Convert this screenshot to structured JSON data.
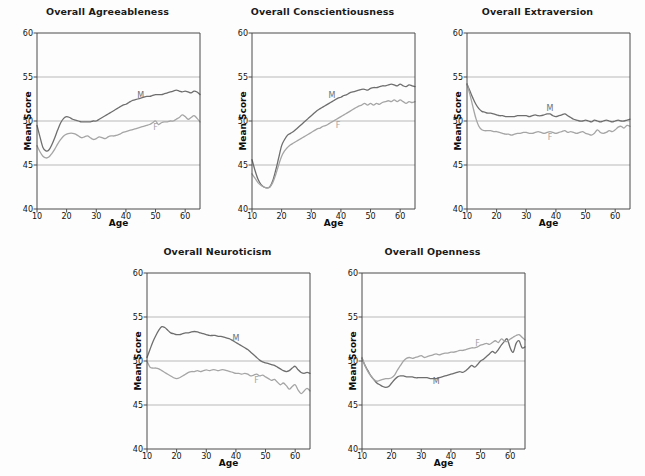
{
  "figure": {
    "background": "#fdfdfd",
    "axis_color": "#4a4a4a",
    "grid_color": "#b9b9b9",
    "male_color": "#6e6e6e",
    "female_color": "#a5a5a5",
    "male_label": "M",
    "female_label": "F",
    "y_axis_label": "Mean Score",
    "x_axis_label": "Age"
  },
  "chart_data": [
    {
      "type": "line",
      "title": "Overall Agreeableness",
      "xlabel": "Age",
      "ylabel": "Mean Score",
      "xlim": [
        10,
        65
      ],
      "ylim": [
        40,
        60
      ],
      "xticks": [
        10,
        20,
        30,
        40,
        50,
        60
      ],
      "yticks": [
        40,
        45,
        50,
        55,
        60
      ],
      "grid": "horizontal",
      "legend": "inline-labels",
      "x": [
        10,
        11,
        12,
        13,
        14,
        15,
        16,
        17,
        18,
        19,
        20,
        21,
        22,
        23,
        24,
        25,
        26,
        27,
        28,
        29,
        30,
        31,
        32,
        33,
        34,
        35,
        36,
        37,
        38,
        39,
        40,
        41,
        42,
        43,
        44,
        45,
        46,
        47,
        48,
        49,
        50,
        51,
        52,
        53,
        54,
        55,
        56,
        57,
        58,
        59,
        60,
        61,
        62,
        63,
        64,
        65
      ],
      "series": [
        {
          "name": "M",
          "label": "M",
          "color": "#6e6e6e",
          "label_x": 45,
          "label_y": 52.9,
          "values": [
            49.5,
            48.2,
            47.0,
            46.6,
            46.7,
            47.3,
            48.1,
            49.0,
            49.8,
            50.3,
            50.5,
            50.4,
            50.2,
            50.1,
            50.0,
            49.9,
            49.9,
            49.9,
            49.9,
            50.0,
            50.0,
            50.2,
            50.4,
            50.6,
            50.8,
            51.0,
            51.2,
            51.4,
            51.6,
            51.8,
            51.9,
            52.1,
            52.3,
            52.4,
            52.5,
            52.6,
            52.7,
            52.8,
            52.8,
            52.9,
            53.0,
            53.0,
            53.0,
            53.1,
            53.2,
            53.3,
            53.4,
            53.5,
            53.4,
            53.3,
            53.4,
            53.3,
            53.2,
            53.4,
            53.3,
            53.0
          ]
        },
        {
          "name": "F",
          "label": "F",
          "color": "#a5a5a5",
          "label_x": 50,
          "label_y": 49.3,
          "values": [
            47.2,
            46.5,
            46.0,
            45.8,
            45.9,
            46.3,
            46.8,
            47.4,
            47.9,
            48.3,
            48.5,
            48.6,
            48.6,
            48.5,
            48.3,
            48.1,
            48.2,
            48.3,
            48.1,
            47.9,
            48.0,
            48.2,
            48.1,
            48.0,
            48.2,
            48.3,
            48.3,
            48.4,
            48.5,
            48.7,
            48.8,
            48.9,
            49.0,
            49.1,
            49.2,
            49.3,
            49.4,
            49.5,
            49.6,
            49.8,
            50.0,
            49.6,
            49.8,
            49.9,
            49.9,
            50.0,
            50.0,
            50.2,
            50.4,
            50.7,
            50.5,
            50.2,
            50.4,
            50.6,
            50.3,
            49.9
          ]
        }
      ]
    },
    {
      "type": "line",
      "title": "Overall Conscientiousness",
      "xlabel": "Age",
      "ylabel": "Mean Score",
      "xlim": [
        10,
        65
      ],
      "ylim": [
        40,
        60
      ],
      "xticks": [
        10,
        20,
        30,
        40,
        50,
        60
      ],
      "yticks": [
        40,
        45,
        50,
        55,
        60
      ],
      "grid": "horizontal",
      "legend": "inline-labels",
      "x": [
        10,
        11,
        12,
        13,
        14,
        15,
        16,
        17,
        18,
        19,
        20,
        21,
        22,
        23,
        24,
        25,
        26,
        27,
        28,
        29,
        30,
        31,
        32,
        33,
        34,
        35,
        36,
        37,
        38,
        39,
        40,
        41,
        42,
        43,
        44,
        45,
        46,
        47,
        48,
        49,
        50,
        51,
        52,
        53,
        54,
        55,
        56,
        57,
        58,
        59,
        60,
        61,
        62,
        63,
        64,
        65
      ],
      "series": [
        {
          "name": "M",
          "label": "M",
          "color": "#6e6e6e",
          "label_x": 37,
          "label_y": 52.9,
          "values": [
            45.6,
            44.4,
            43.4,
            42.8,
            42.5,
            42.4,
            42.5,
            43.2,
            44.4,
            45.8,
            47.2,
            47.9,
            48.4,
            48.6,
            48.8,
            49.1,
            49.4,
            49.7,
            50.0,
            50.3,
            50.6,
            50.9,
            51.2,
            51.4,
            51.6,
            51.8,
            52.0,
            52.2,
            52.4,
            52.6,
            52.7,
            52.9,
            53.0,
            53.2,
            53.3,
            53.4,
            53.5,
            53.6,
            53.6,
            53.5,
            53.7,
            53.8,
            53.8,
            53.9,
            54.0,
            54.0,
            54.1,
            54.2,
            54.1,
            54.0,
            54.2,
            54.0,
            53.9,
            54.1,
            54.0,
            53.9
          ]
        },
        {
          "name": "F",
          "label": "F",
          "color": "#a5a5a5",
          "label_x": 39,
          "label_y": 49.6,
          "values": [
            44.0,
            43.5,
            43.0,
            42.7,
            42.5,
            42.4,
            42.5,
            43.0,
            43.9,
            45.0,
            46.0,
            46.6,
            47.0,
            47.3,
            47.5,
            47.7,
            47.9,
            48.1,
            48.3,
            48.5,
            48.7,
            48.9,
            49.1,
            49.2,
            49.4,
            49.5,
            49.7,
            49.9,
            50.1,
            50.3,
            50.5,
            50.7,
            50.9,
            51.1,
            51.3,
            51.5,
            51.7,
            51.8,
            52.0,
            51.8,
            52.0,
            51.8,
            52.0,
            51.9,
            52.1,
            52.2,
            52.3,
            52.2,
            52.4,
            52.2,
            52.4,
            52.2,
            52.0,
            52.2,
            52.1,
            52.2
          ]
        }
      ]
    },
    {
      "type": "line",
      "title": "Overall Extraversion",
      "xlabel": "Age",
      "ylabel": "Mean Score",
      "xlim": [
        10,
        65
      ],
      "ylim": [
        40,
        60
      ],
      "xticks": [
        10,
        20,
        30,
        40,
        50,
        60
      ],
      "yticks": [
        40,
        45,
        50,
        55,
        60
      ],
      "grid": "horizontal",
      "legend": "inline-labels",
      "x": [
        10,
        11,
        12,
        13,
        14,
        15,
        16,
        17,
        18,
        19,
        20,
        21,
        22,
        23,
        24,
        25,
        26,
        27,
        28,
        29,
        30,
        31,
        32,
        33,
        34,
        35,
        36,
        37,
        38,
        39,
        40,
        41,
        42,
        43,
        44,
        45,
        46,
        47,
        48,
        49,
        50,
        51,
        52,
        53,
        54,
        55,
        56,
        57,
        58,
        59,
        60,
        61,
        62,
        63,
        64,
        65
      ],
      "series": [
        {
          "name": "M",
          "label": "M",
          "color": "#6e6e6e",
          "label_x": 38,
          "label_y": 51.5,
          "values": [
            54.2,
            53.4,
            52.6,
            51.9,
            51.4,
            51.1,
            51.0,
            50.9,
            50.9,
            50.8,
            50.7,
            50.6,
            50.6,
            50.5,
            50.5,
            50.5,
            50.5,
            50.6,
            50.6,
            50.6,
            50.6,
            50.5,
            50.6,
            50.7,
            50.6,
            50.6,
            50.7,
            50.8,
            50.8,
            50.6,
            50.5,
            50.6,
            50.7,
            50.8,
            50.6,
            50.4,
            50.2,
            50.1,
            50.0,
            50.0,
            50.1,
            50.0,
            49.9,
            50.1,
            50.0,
            49.9,
            50.0,
            50.1,
            50.0,
            49.9,
            50.0,
            50.1,
            50.0,
            50.0,
            50.1,
            50.2
          ]
        },
        {
          "name": "F",
          "label": "F",
          "color": "#a5a5a5",
          "label_x": 38,
          "label_y": 48.2,
          "values": [
            54.2,
            53.0,
            51.6,
            50.3,
            49.4,
            49.0,
            48.9,
            48.9,
            48.9,
            48.8,
            48.8,
            48.7,
            48.6,
            48.5,
            48.5,
            48.4,
            48.5,
            48.6,
            48.6,
            48.7,
            48.7,
            48.6,
            48.6,
            48.7,
            48.8,
            48.7,
            48.6,
            48.7,
            48.8,
            48.7,
            48.6,
            48.7,
            48.8,
            48.9,
            48.7,
            48.8,
            48.7,
            48.6,
            48.7,
            48.8,
            48.6,
            48.5,
            48.4,
            48.6,
            49.0,
            48.7,
            48.6,
            48.7,
            48.9,
            48.8,
            49.0,
            49.3,
            49.4,
            49.2,
            49.5,
            49.4
          ]
        }
      ]
    },
    {
      "type": "line",
      "title": "Overall Neuroticism",
      "xlabel": "Age",
      "ylabel": "Mean Score",
      "xlim": [
        10,
        65
      ],
      "ylim": [
        40,
        60
      ],
      "xticks": [
        10,
        20,
        30,
        40,
        50,
        60
      ],
      "yticks": [
        40,
        45,
        50,
        55,
        60
      ],
      "grid": "horizontal",
      "legend": "inline-labels",
      "x": [
        10,
        11,
        12,
        13,
        14,
        15,
        16,
        17,
        18,
        19,
        20,
        21,
        22,
        23,
        24,
        25,
        26,
        27,
        28,
        29,
        30,
        31,
        32,
        33,
        34,
        35,
        36,
        37,
        38,
        39,
        40,
        41,
        42,
        43,
        44,
        45,
        46,
        47,
        48,
        49,
        50,
        51,
        52,
        53,
        54,
        55,
        56,
        57,
        58,
        59,
        60,
        61,
        62,
        63,
        64,
        65
      ],
      "series": [
        {
          "name": "M",
          "label": "M",
          "color": "#6e6e6e",
          "label_x": 40,
          "label_y": 52.6,
          "values": [
            50.4,
            51.3,
            52.2,
            52.9,
            53.5,
            53.9,
            53.8,
            53.5,
            53.2,
            53.1,
            53.0,
            53.0,
            53.1,
            53.2,
            53.2,
            53.3,
            53.35,
            53.3,
            53.2,
            53.1,
            53.0,
            52.9,
            52.9,
            52.9,
            52.8,
            52.8,
            52.7,
            52.6,
            52.5,
            52.3,
            52.1,
            51.9,
            51.7,
            51.5,
            51.3,
            51.0,
            50.7,
            50.4,
            50.1,
            49.9,
            49.8,
            49.7,
            49.6,
            49.5,
            49.3,
            49.1,
            48.9,
            48.8,
            48.9,
            49.2,
            49.4,
            49.0,
            48.7,
            48.6,
            48.7,
            48.6
          ]
        },
        {
          "name": "F",
          "label": "F",
          "color": "#a5a5a5",
          "label_x": 47,
          "label_y": 47.8,
          "values": [
            50.0,
            49.3,
            49.2,
            49.2,
            49.1,
            48.9,
            48.7,
            48.5,
            48.3,
            48.1,
            48.0,
            48.1,
            48.3,
            48.5,
            48.7,
            48.8,
            48.8,
            48.9,
            48.8,
            48.9,
            49.0,
            48.9,
            49.0,
            49.0,
            48.9,
            49.0,
            49.0,
            48.9,
            48.8,
            48.7,
            48.6,
            48.6,
            48.5,
            48.6,
            48.5,
            48.3,
            48.4,
            48.5,
            48.3,
            48.4,
            48.2,
            48.0,
            47.8,
            47.9,
            47.6,
            47.3,
            47.5,
            47.2,
            46.8,
            47.1,
            47.3,
            46.7,
            46.3,
            46.6,
            46.9,
            46.6
          ]
        }
      ]
    },
    {
      "type": "line",
      "title": "Overall Openness",
      "xlabel": "Age",
      "ylabel": "Mean Score",
      "xlim": [
        10,
        65
      ],
      "ylim": [
        40,
        60
      ],
      "xticks": [
        10,
        20,
        30,
        40,
        50,
        60
      ],
      "yticks": [
        40,
        45,
        50,
        55,
        60
      ],
      "grid": "horizontal",
      "legend": "inline-labels",
      "x": [
        10,
        11,
        12,
        13,
        14,
        15,
        16,
        17,
        18,
        19,
        20,
        21,
        22,
        23,
        24,
        25,
        26,
        27,
        28,
        29,
        30,
        31,
        32,
        33,
        34,
        35,
        36,
        37,
        38,
        39,
        40,
        41,
        42,
        43,
        44,
        45,
        46,
        47,
        48,
        49,
        50,
        51,
        52,
        53,
        54,
        55,
        56,
        57,
        58,
        59,
        60,
        61,
        62,
        63,
        64,
        65
      ],
      "series": [
        {
          "name": "M",
          "label": "M",
          "color": "#6e6e6e",
          "label_x": 35,
          "label_y": 47.7,
          "values": [
            50.3,
            49.5,
            48.9,
            48.3,
            47.9,
            47.5,
            47.3,
            47.1,
            47.0,
            47.1,
            47.5,
            47.9,
            48.2,
            48.3,
            48.3,
            48.2,
            48.2,
            48.2,
            48.1,
            48.1,
            48.1,
            48.1,
            48.1,
            48.0,
            48.0,
            48.0,
            48.1,
            48.2,
            48.3,
            48.4,
            48.5,
            48.6,
            48.7,
            48.8,
            48.7,
            48.9,
            49.2,
            49.5,
            49.3,
            49.6,
            50.0,
            50.2,
            50.5,
            50.8,
            51.1,
            50.9,
            51.3,
            51.8,
            52.2,
            52.5,
            51.5,
            51.0,
            52.0,
            52.3,
            51.5,
            51.6
          ]
        },
        {
          "name": "F",
          "label": "F",
          "color": "#a5a5a5",
          "label_x": 49,
          "label_y": 52.0,
          "values": [
            50.4,
            49.5,
            48.8,
            48.3,
            47.9,
            47.7,
            47.8,
            47.9,
            48.0,
            48.0,
            48.1,
            48.4,
            49.0,
            49.5,
            50.0,
            50.3,
            50.4,
            50.3,
            50.4,
            50.5,
            50.6,
            50.4,
            50.5,
            50.6,
            50.7,
            50.8,
            50.7,
            50.8,
            50.9,
            50.9,
            51.0,
            51.0,
            51.1,
            51.2,
            51.2,
            51.3,
            51.4,
            51.5,
            51.5,
            51.6,
            51.8,
            51.9,
            52.0,
            51.9,
            52.1,
            52.3,
            52.1,
            52.5,
            52.3,
            52.2,
            52.5,
            52.7,
            52.9,
            53.0,
            52.7,
            52.4
          ]
        }
      ]
    }
  ]
}
